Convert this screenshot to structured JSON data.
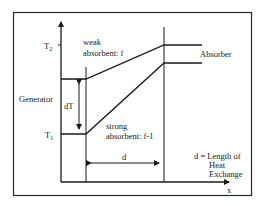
{
  "diagram": {
    "y_labels": {
      "t2": "T",
      "t2_sub": "2",
      "t1": "T",
      "t1_sub": "1"
    },
    "x_label": "x",
    "labels": {
      "weak_line1": "weak",
      "weak_line2": "absorbent: f",
      "strong_line1": "strong",
      "strong_line2": "absorbent: f-1",
      "absorber": "Absorber",
      "generator": "Generator",
      "dT": "dT",
      "d": "d",
      "legend_line1": "d = Length of",
      "legend_line2": "Heat",
      "legend_line3": "Exchange"
    },
    "colors": {
      "ink": "#1a1a1a",
      "background": "#ffffff"
    }
  }
}
